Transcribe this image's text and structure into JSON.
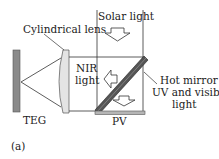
{
  "labels": {
    "cylindrical_lens": "Cylindrical lens",
    "solar_light": "Solar light",
    "nir_light_line1": "NIR",
    "nir_light_line2": "light",
    "hot_mirror": "Hot mirror",
    "uv_visible_line1": "UV and visible",
    "uv_visible_line2": "light",
    "teg": "TEG",
    "pv": "PV",
    "panel": "(a)"
  },
  "colors": {
    "line": "#333333",
    "teg_fill": "#8a8a8a",
    "lens_fill": "#e4e4e4",
    "mirror_fill": "#555555",
    "pv_fill": "#b5b5b5"
  }
}
